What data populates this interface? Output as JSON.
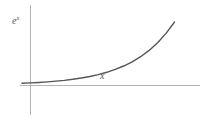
{
  "figure": {
    "background_color": "#ffffff",
    "width": 215,
    "height": 121
  },
  "labels": {
    "y_axis_base": "e",
    "y_axis_exponent": "x",
    "y_axis_full": "e^x",
    "x_axis": "x"
  },
  "style": {
    "curve_color": "#555555",
    "axis_color": "#b3b3b3",
    "label_color": "#5a5a5a",
    "curve_width": 1.4,
    "axis_width": 1
  },
  "chart_data": {
    "type": "line",
    "title": "",
    "subtitle": "",
    "xlabel": "x",
    "ylabel": "e^x",
    "grid": false,
    "legend": null,
    "annotations": [
      {
        "text": "e^x",
        "role": "y-axis-label",
        "x_px": 14,
        "y_px": 22
      },
      {
        "text": "x",
        "role": "x-axis-label",
        "x_px": 103,
        "y_px": 78
      }
    ],
    "axes": {
      "x_axis_pixel_y": 85,
      "y_axis_pixel_x": 30,
      "x_axis_pixel_range": [
        20,
        200
      ],
      "y_axis_pixel_range": [
        5,
        115
      ],
      "origin_px": [
        30,
        85
      ],
      "xlim": [
        -0.4,
        3.4
      ],
      "ylim": [
        0,
        14.5
      ]
    },
    "series": [
      {
        "name": "e^x",
        "color": "#555555",
        "x": [
          -0.4,
          -0.2,
          0.0,
          0.2,
          0.4,
          0.6,
          0.8,
          1.0,
          1.2,
          1.4,
          1.6,
          1.8,
          2.0,
          2.2,
          2.4,
          2.6,
          2.8,
          3.0,
          3.2
        ],
        "y": [
          0.67,
          0.82,
          1.0,
          1.22,
          1.49,
          1.82,
          2.23,
          2.72,
          3.32,
          4.06,
          4.95,
          6.05,
          7.39,
          9.03,
          11.02,
          13.46,
          16.44,
          20.09,
          24.53
        ],
        "pixel_points": [
          [
            22,
            84.6
          ],
          [
            28,
            84.1
          ],
          [
            34,
            83.5
          ],
          [
            40,
            82.6
          ],
          [
            46,
            81.5
          ],
          [
            52,
            80.1
          ],
          [
            58,
            78.3
          ],
          [
            64,
            76.0
          ],
          [
            70,
            73.2
          ],
          [
            76,
            69.7
          ],
          [
            82,
            65.4
          ],
          [
            88,
            60.2
          ],
          [
            94,
            54.0
          ],
          [
            100,
            46.7
          ],
          [
            106,
            38.3
          ],
          [
            112,
            28.8
          ],
          [
            118,
            18.6
          ],
          [
            124,
            8.0
          ],
          [
            130,
            -2.0
          ]
        ]
      }
    ]
  }
}
